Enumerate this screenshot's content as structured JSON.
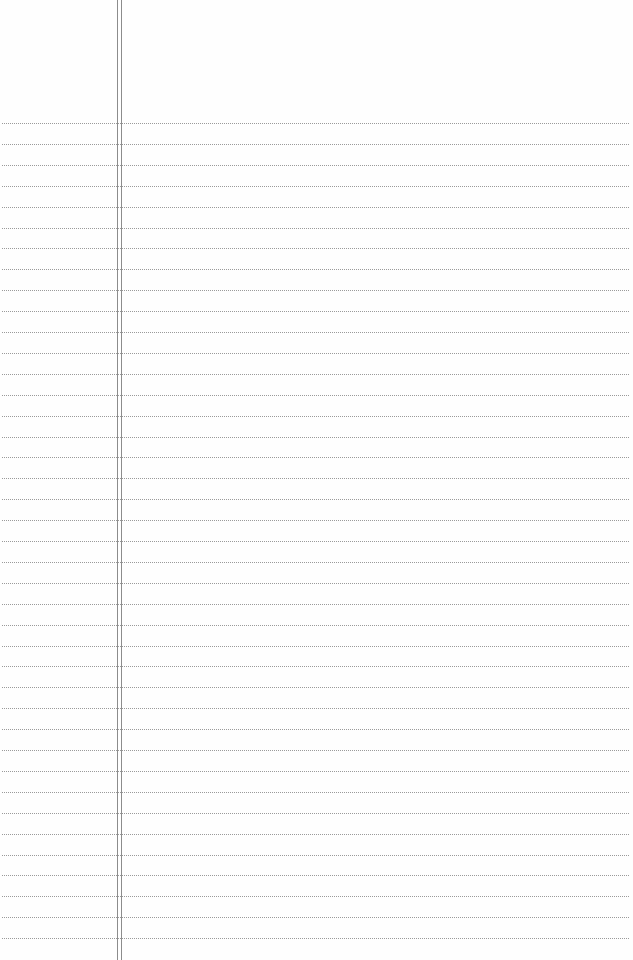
{
  "paper": {
    "type": "lined-paper",
    "background_color": "#fefefe",
    "rule_color": "#9a9a9a",
    "margin_line_color": "#8c8c8c",
    "rule_count": 40,
    "first_rule_y": 123,
    "rule_spacing": 20.9,
    "margin_lines_x": [
      117,
      121
    ]
  }
}
